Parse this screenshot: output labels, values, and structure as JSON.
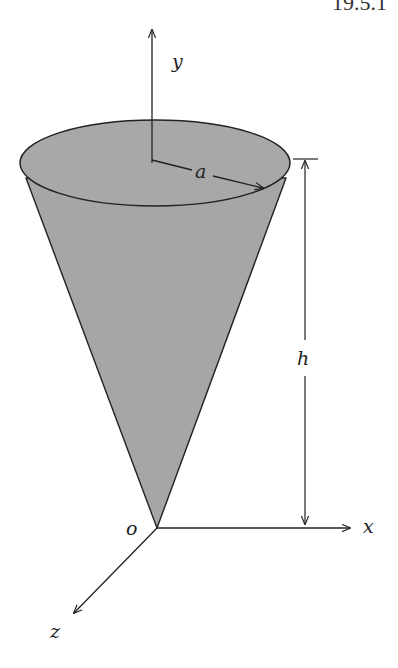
{
  "header": {
    "section_number": "19.5.1"
  },
  "figure": {
    "colors": {
      "cone_fill": "#a6a6a6",
      "stroke": "#222222",
      "background": "#ffffff"
    },
    "labels": {
      "y_axis": "y",
      "x_axis": "x",
      "z_axis": "z",
      "origin": "o",
      "radius": "a",
      "height": "h"
    }
  }
}
